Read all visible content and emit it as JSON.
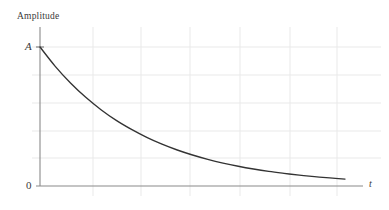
{
  "figure": {
    "title": "",
    "background_color": "#ffffff",
    "width": 389,
    "height": 210
  },
  "labels": {
    "y_axis_title": "Amplitude",
    "y_tick_top": "A",
    "y_tick_bottom": "0",
    "x_axis_title": "t"
  },
  "colors": {
    "curve": "#333333",
    "axis": "#777777",
    "grid": "#e9e9e9",
    "text": "#3a3a3a"
  },
  "chart_data": {
    "type": "line",
    "title": "",
    "xlabel": "t",
    "ylabel": "Amplitude",
    "grid": true,
    "legend": null,
    "xlim": [
      0,
      1
    ],
    "ylim": [
      0,
      1
    ],
    "xticks": [],
    "yticks": [
      0,
      1
    ],
    "ytick_labels": [
      "0",
      "A"
    ],
    "xtick_labels": [],
    "series": [
      {
        "name": "amplitude-decay",
        "x": [
          0.0,
          0.05,
          0.1,
          0.15,
          0.2,
          0.25,
          0.3,
          0.35,
          0.4,
          0.45,
          0.5,
          0.55,
          0.6,
          0.65,
          0.7,
          0.75,
          0.8,
          0.85,
          0.9,
          0.95,
          1.0
        ],
        "y": [
          1.0,
          0.861,
          0.741,
          0.638,
          0.549,
          0.472,
          0.407,
          0.35,
          0.301,
          0.259,
          0.223,
          0.192,
          0.165,
          0.142,
          0.122,
          0.105,
          0.091,
          0.078,
          0.067,
          0.058,
          0.05
        ]
      }
    ]
  },
  "geometry": {
    "origin_x": 40,
    "origin_y": 186,
    "plot_right": 345,
    "plot_top": 47,
    "axis_x_end": 363,
    "axis_y_top": 27,
    "grid_x": [
      93,
      141,
      190,
      240,
      290,
      337
    ],
    "grid_y": [
      47,
      75,
      103,
      131,
      158
    ]
  }
}
